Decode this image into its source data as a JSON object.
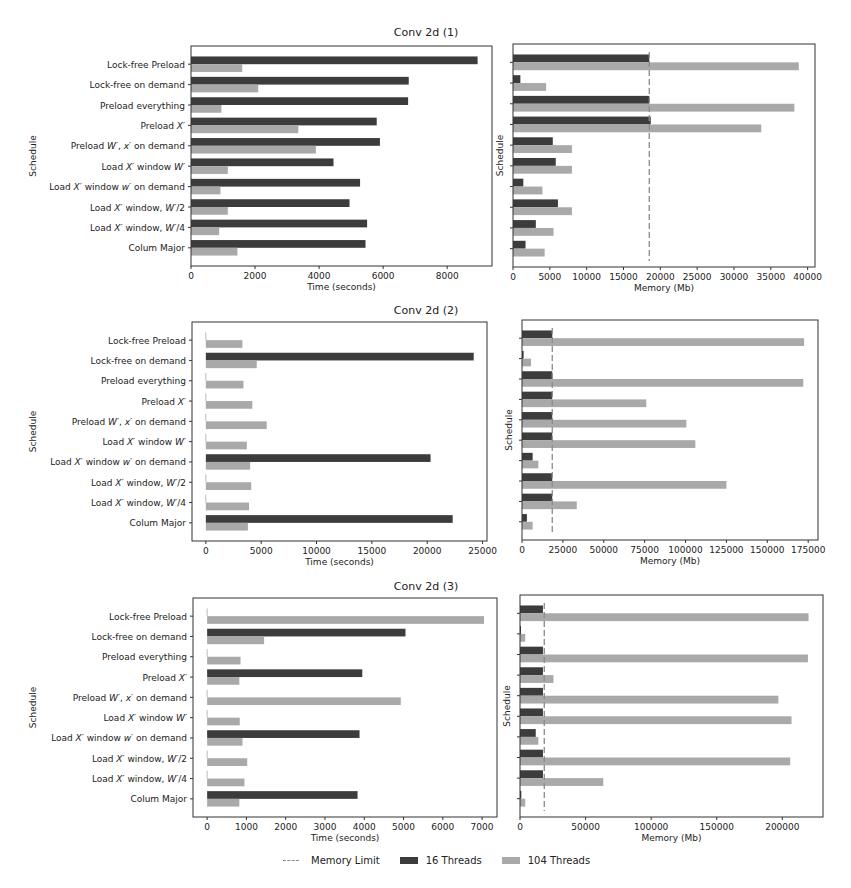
{
  "figure": {
    "legend": [
      {
        "label": "Memory Limit",
        "kind": "dashed-line",
        "color": "#8a8a8a"
      },
      {
        "label": "16 Threads",
        "kind": "box",
        "color": "#3c3c3c"
      },
      {
        "label": "104 Threads",
        "kind": "box",
        "color": "#a9a9a9"
      }
    ]
  },
  "colors": {
    "threads16": "#3c3c3c",
    "threads104": "#a9a9a9",
    "limit": "#8a8a8a",
    "axis": "#333333"
  },
  "chart_data": [
    {
      "type": "bar",
      "orientation": "horizontal",
      "title": "Conv 2d (1)",
      "panel": "time",
      "xlabel": "Time (seconds)",
      "ylabel": "Schedule",
      "categories": [
        "Lock-free Preload",
        "Lock-free on demand",
        "Preload everything",
        "Preload X'",
        "Preload W', x' on demand",
        "Load X' window W'",
        "Load X' window w' on demand",
        "Load X' window, W'/2",
        "Load X' window, W'/4",
        "Colum Major"
      ],
      "xlim": [
        0,
        9400
      ],
      "xticks": [
        0,
        2000,
        4000,
        6000,
        8000
      ],
      "series": [
        {
          "name": "16 Threads",
          "values": [
            8950,
            6800,
            6780,
            5800,
            5900,
            4450,
            5280,
            4950,
            5500,
            5450
          ]
        },
        {
          "name": "104 Threads",
          "values": [
            1600,
            2100,
            950,
            3350,
            3900,
            1150,
            920,
            1150,
            880,
            1450
          ]
        }
      ]
    },
    {
      "type": "bar",
      "orientation": "horizontal",
      "title": "Conv 2d (1)",
      "panel": "memory",
      "xlabel": "Memory (Mb)",
      "ylabel": "Schedule",
      "categories": [
        "Lock-free Preload",
        "Lock-free on demand",
        "Preload everything",
        "Preload X'",
        "Preload W', x' on demand",
        "Load X' window W'",
        "Load X' window w' on demand",
        "Load X' window, W'/2",
        "Load X' window, W'/4",
        "Colum Major"
      ],
      "xlim": [
        0,
        41000
      ],
      "xticks": [
        0,
        5000,
        10000,
        15000,
        20000,
        25000,
        30000,
        35000,
        40000
      ],
      "memory_limit": 18500,
      "series": [
        {
          "name": "16 Threads",
          "values": [
            18500,
            1000,
            18500,
            18700,
            5400,
            5800,
            1400,
            6100,
            3100,
            1700
          ]
        },
        {
          "name": "104 Threads",
          "values": [
            38800,
            4500,
            38200,
            33700,
            8000,
            8000,
            4000,
            8000,
            5500,
            4300
          ]
        }
      ]
    },
    {
      "type": "bar",
      "orientation": "horizontal",
      "title": "Conv 2d (2)",
      "panel": "time",
      "xlabel": "Time (seconds)",
      "ylabel": "Schedule",
      "categories": [
        "Lock-free Preload",
        "Lock-free on demand",
        "Preload everything",
        "Preload X'",
        "Preload W', x' on demand",
        "Load X' window W'",
        "Load X' window w' on demand",
        "Load X' window, W'/2",
        "Load X' window, W'/4",
        "Colum Major"
      ],
      "xlim": [
        -1250,
        25400
      ],
      "xticks": [
        0,
        5000,
        10000,
        15000,
        20000,
        25000
      ],
      "series": [
        {
          "name": "16 Threads",
          "values": [
            0,
            24200,
            0,
            0,
            0,
            0,
            20300,
            0,
            0,
            22300
          ]
        },
        {
          "name": "104 Threads",
          "values": [
            3300,
            4600,
            3400,
            4200,
            5500,
            3700,
            4000,
            4100,
            3900,
            3800
          ]
        }
      ]
    },
    {
      "type": "bar",
      "orientation": "horizontal",
      "title": "Conv 2d (2)",
      "panel": "memory",
      "xlabel": "Memory (Mb)",
      "ylabel": "Schedule",
      "categories": [
        "Lock-free Preload",
        "Lock-free on demand",
        "Preload everything",
        "Preload X'",
        "Preload W', x' on demand",
        "Load X' window W'",
        "Load X' window w' on demand",
        "Load X' window, W'/2",
        "Load X' window, W'/4",
        "Colum Major"
      ],
      "xlim": [
        0,
        181000
      ],
      "xticks": [
        0,
        25000,
        50000,
        75000,
        100000,
        125000,
        150000,
        175000
      ],
      "memory_limit": 18500,
      "series": [
        {
          "name": "16 Threads",
          "values": [
            18500,
            1000,
            18500,
            18500,
            18500,
            18500,
            6500,
            18500,
            18500,
            3000
          ]
        },
        {
          "name": "104 Threads",
          "values": [
            172500,
            5500,
            172000,
            76000,
            100500,
            106000,
            10000,
            125000,
            33500,
            6500
          ]
        }
      ]
    },
    {
      "type": "bar",
      "orientation": "horizontal",
      "title": "Conv 2d (3)",
      "panel": "time",
      "xlabel": "Time (seconds)",
      "ylabel": "Schedule",
      "categories": [
        "Lock-free Preload",
        "Lock-free on demand",
        "Preload everything",
        "Preload X'",
        "Preload W', x' on demand",
        "Load X' window W'",
        "Load X' window w' on demand",
        "Load X' window, W'/2",
        "Load X' window, W'/4",
        "Colum Major"
      ],
      "xlim": [
        -360,
        7380
      ],
      "xticks": [
        0,
        1000,
        2000,
        3000,
        4000,
        5000,
        6000,
        7000
      ],
      "series": [
        {
          "name": "16 Threads",
          "values": [
            0,
            5050,
            0,
            3950,
            0,
            0,
            3880,
            0,
            0,
            3830
          ]
        },
        {
          "name": "104 Threads",
          "values": [
            7050,
            1450,
            850,
            820,
            4930,
            830,
            900,
            1020,
            950,
            820
          ]
        }
      ]
    },
    {
      "type": "bar",
      "orientation": "horizontal",
      "title": "Conv 2d (3)",
      "panel": "memory",
      "xlabel": "Memory (Mb)",
      "ylabel": "Schedule",
      "categories": [
        "Lock-free Preload",
        "Lock-free on demand",
        "Preload everything",
        "Preload X'",
        "Preload W', x' on demand",
        "Load X' window W'",
        "Load X' window w' on demand",
        "Load X' window, W'/2",
        "Load X' window, W'/4",
        "Colum Major"
      ],
      "xlim": [
        0,
        231000
      ],
      "xticks": [
        0,
        50000,
        100000,
        150000,
        200000
      ],
      "memory_limit": 18500,
      "series": [
        {
          "name": "16 Threads",
          "values": [
            17500,
            500,
            17500,
            17500,
            17500,
            17500,
            12000,
            17500,
            17500,
            1000
          ]
        },
        {
          "name": "104 Threads",
          "values": [
            220000,
            4000,
            219500,
            25500,
            197000,
            207000,
            14000,
            206000,
            63500,
            4000
          ]
        }
      ]
    }
  ]
}
